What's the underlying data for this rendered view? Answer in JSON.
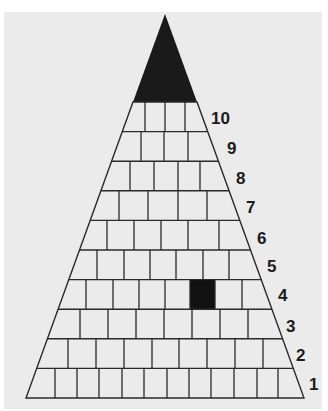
{
  "diagram": {
    "type": "pyramid",
    "apex_fill": "#1a1a1a",
    "brick_fill": "#ebebeb",
    "line_color": "#2a2a2a",
    "highlight_fill": "#111111",
    "levels": [
      {
        "label": "1",
        "bricks": 12
      },
      {
        "label": "2",
        "bricks": 9
      },
      {
        "label": "3",
        "bricks": 8
      },
      {
        "label": "4",
        "bricks": 8,
        "highlighted_brick": 6
      },
      {
        "label": "5",
        "bricks": 7
      },
      {
        "label": "6",
        "bricks": 6
      },
      {
        "label": "7",
        "bricks": 5
      },
      {
        "label": "8",
        "bricks": 5
      },
      {
        "label": "9",
        "bricks": 4
      },
      {
        "label": "10",
        "bricks": 4
      }
    ]
  }
}
